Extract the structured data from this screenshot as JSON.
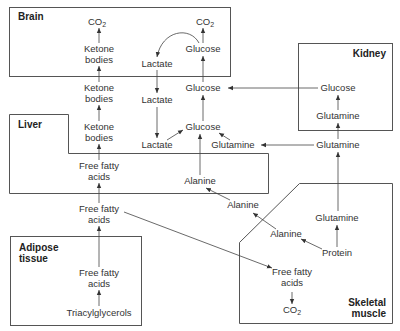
{
  "compartments": {
    "brain": {
      "title": "Brain"
    },
    "liver": {
      "title": "Liver"
    },
    "kidney": {
      "title": "Kidney"
    },
    "adipose": {
      "title_line1": "Adipose",
      "title_line2": "tissue"
    },
    "muscle": {
      "title_line1": "Skeletal",
      "title_line2": "muscle"
    }
  },
  "nodes": {
    "brain_co2_a": "CO",
    "brain_co2_b": "CO",
    "co2_sub": "2",
    "brain_ketone_l1": "Ketone",
    "brain_ketone_l2": "bodies",
    "brain_lactate": "Lactate",
    "brain_glucose": "Glucose",
    "blood_ketone_l1": "Ketone",
    "blood_ketone_l2": "bodies",
    "blood_lactate": "Lactate",
    "blood_glucose": "Glucose",
    "kidney_glucose": "Glucose",
    "kidney_glutamine": "Glutamine",
    "liver_ketone_l1": "Ketone",
    "liver_ketone_l2": "bodies",
    "liver_lactate": "Lactate",
    "liver_glucose": "Glucose",
    "liver_glutamine": "Glutamine",
    "liver_ffa_l1": "Free fatty",
    "liver_ffa_l2": "acids",
    "liver_alanine": "Alanine",
    "blood_glutamine": "Glutamine",
    "blood_alanine": "Alanine",
    "blood_ffa_l1": "Free fatty",
    "blood_ffa_l2": "acids",
    "muscle_glutamine": "Glutamine",
    "muscle_alanine": "Alanine",
    "muscle_protein": "Protein",
    "muscle_ffa_l1": "Free fatty",
    "muscle_ffa_l2": "acids",
    "muscle_co2": "CO",
    "adipose_ffa_l1": "Free fatty",
    "adipose_ffa_l2": "acids",
    "adipose_tag": "Triacylglycerols"
  },
  "colors": {
    "stroke": "#555555",
    "text": "#333333",
    "background": "#ffffff"
  }
}
